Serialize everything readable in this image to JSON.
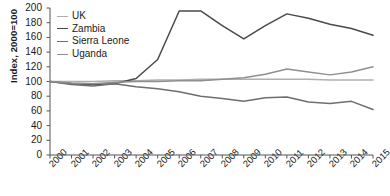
{
  "chart_data": {
    "type": "line",
    "title": "",
    "xlabel": "",
    "ylabel": "Index, 2000=100",
    "x": [
      2000,
      2001,
      2002,
      2003,
      2004,
      2005,
      2006,
      2007,
      2008,
      2009,
      2010,
      2011,
      2012,
      2013,
      2014,
      2015
    ],
    "xtick_labels": [
      "2000",
      "2001",
      "2002",
      "2003",
      "2004",
      "2005",
      "2006",
      "2007",
      "2008",
      "2009",
      "2010",
      "2011",
      "2012",
      "2013",
      "2014",
      "2015"
    ],
    "ytick_labels": [
      "0",
      "20",
      "40",
      "60",
      "80",
      "100",
      "120",
      "140",
      "160",
      "180",
      "200"
    ],
    "yticks": [
      0,
      20,
      40,
      60,
      80,
      100,
      120,
      140,
      160,
      180,
      200
    ],
    "ylim": [
      0,
      200
    ],
    "xlim": [
      2000,
      2015
    ],
    "grid": false,
    "legend_position": "top-left",
    "series": [
      {
        "name": "UK",
        "color": "#b0b0b0",
        "values": [
          100,
          100,
          100,
          101,
          101,
          102,
          102,
          103,
          103,
          103,
          103,
          103,
          103,
          102,
          102,
          102
        ]
      },
      {
        "name": "Zambia",
        "color": "#4a4a4a",
        "values": [
          100,
          97,
          96,
          97,
          104,
          130,
          196,
          196,
          176,
          158,
          176,
          192,
          186,
          178,
          172,
          163
        ]
      },
      {
        "name": "Sierra Leone",
        "color": "#6e6e6e",
        "values": [
          100,
          96,
          94,
          97,
          93,
          90,
          86,
          80,
          77,
          73,
          78,
          79,
          72,
          70,
          73,
          62
        ]
      },
      {
        "name": "Uganda",
        "color": "#8f8f8f",
        "values": [
          100,
          98,
          97,
          99,
          100,
          100,
          101,
          101,
          103,
          105,
          110,
          117,
          113,
          109,
          113,
          120
        ]
      }
    ]
  }
}
